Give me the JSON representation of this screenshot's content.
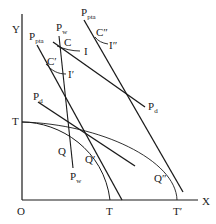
{
  "diagram": {
    "type": "economics-production-possibility-frontier",
    "axes": {
      "y_label": "Y",
      "x_label": "X",
      "origin_label": "O"
    },
    "frontiers": [
      {
        "name": "inner-ppf",
        "endpoint_y_label": "T",
        "endpoint_x_label": "T"
      },
      {
        "name": "outer-ppf",
        "endpoint_y_label": "T",
        "endpoint_x_label": "T′"
      }
    ],
    "price_lines": [
      {
        "name": "pw-line",
        "label": "P",
        "sub": "w",
        "bottom_label": "P",
        "bottom_sub": "w"
      },
      {
        "name": "ppta-left-line",
        "label": "P",
        "sub": "pta"
      },
      {
        "name": "ppta-right-line",
        "label": "P",
        "sub": "pta"
      },
      {
        "name": "pd-long-line",
        "label": "P",
        "sub": "d"
      },
      {
        "name": "pd-short-line",
        "label": "P",
        "sub": "d"
      }
    ],
    "points": {
      "C": "C",
      "C_prime": "C′",
      "C_dprime": "C″",
      "Q": "Q",
      "Q_prime": "Q′",
      "Q_dprime": "Q″"
    },
    "indifference_curves": {
      "I": "I",
      "I_prime": "I′",
      "I_dprime": "I″"
    }
  }
}
